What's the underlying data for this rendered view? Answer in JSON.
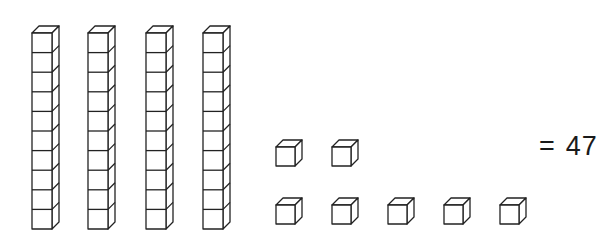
{
  "figure": {
    "caption_cut_off": "",
    "equation": {
      "equals_sign": "=",
      "value": "47"
    },
    "stroke_color": "#222222",
    "background": "#ffffff"
  },
  "blocks": {
    "tens_rods": {
      "count": 4,
      "cubes_per_rod": 10,
      "x_positions": [
        32,
        88,
        146,
        203
      ],
      "top_y": 26,
      "front_width": 20,
      "cube_height": 19.6,
      "depth_dx": 7,
      "depth_dy": -7
    },
    "ones_cubes": {
      "count": 7,
      "rows": [
        {
          "y": 147,
          "x_positions": [
            276,
            332
          ]
        },
        {
          "y": 205,
          "x_positions": [
            276,
            332,
            388,
            444,
            500
          ]
        }
      ],
      "size": 19,
      "depth_dx": 7,
      "depth_dy": -7
    }
  },
  "chart_data": {
    "type": "table",
    "categories": [
      "Tens",
      "Ones"
    ],
    "values": [
      4,
      7
    ],
    "total": 47
  }
}
